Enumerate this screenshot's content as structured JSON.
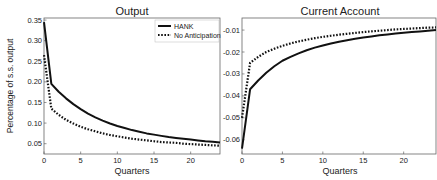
{
  "chart_data": [
    {
      "type": "line",
      "title": "Output",
      "xlabel": "Quarters",
      "ylabel": "Percentage of s.s. output",
      "xlim": [
        0,
        24
      ],
      "ylim": [
        0.025,
        0.355
      ],
      "xticks": [
        "0",
        "5",
        "10",
        "15",
        "20"
      ],
      "yticks": [
        "0.05",
        "0.10",
        "0.15",
        "0.20",
        "0.25",
        "0.30",
        "0.35"
      ],
      "grid": false,
      "legend": {
        "position": "upper right",
        "entries": [
          "HANK",
          "No Anticipation"
        ]
      },
      "x": [
        0,
        1,
        2,
        3,
        4,
        5,
        6,
        7,
        8,
        9,
        10,
        11,
        12,
        13,
        14,
        15,
        16,
        17,
        18,
        19,
        20,
        21,
        22,
        23,
        24
      ],
      "series": [
        {
          "name": "HANK",
          "style": "solid",
          "values": [
            0.345,
            0.195,
            0.176,
            0.16,
            0.146,
            0.134,
            0.123,
            0.114,
            0.106,
            0.099,
            0.093,
            0.088,
            0.083,
            0.079,
            0.075,
            0.072,
            0.069,
            0.066,
            0.064,
            0.062,
            0.06,
            0.058,
            0.056,
            0.055,
            0.053
          ]
        },
        {
          "name": "No Anticipation",
          "style": "dotted",
          "values": [
            0.265,
            0.135,
            0.12,
            0.108,
            0.099,
            0.091,
            0.085,
            0.08,
            0.075,
            0.071,
            0.068,
            0.065,
            0.062,
            0.06,
            0.058,
            0.056,
            0.054,
            0.053,
            0.052,
            0.05,
            0.049,
            0.048,
            0.047,
            0.046,
            0.045
          ]
        }
      ]
    },
    {
      "type": "line",
      "title": "Current Account",
      "xlabel": "Quarters",
      "ylabel": "",
      "xlim": [
        0,
        24
      ],
      "ylim": [
        -0.0665,
        -0.0045
      ],
      "xticks": [
        "0",
        "5",
        "10",
        "15",
        "20"
      ],
      "yticks": [
        "-0.06",
        "-0.05",
        "-0.04",
        "-0.03",
        "-0.02",
        "-0.01"
      ],
      "grid": false,
      "x": [
        0,
        1,
        2,
        3,
        4,
        5,
        6,
        7,
        8,
        9,
        10,
        11,
        12,
        13,
        14,
        15,
        16,
        17,
        18,
        19,
        20,
        21,
        22,
        23,
        24
      ],
      "series": [
        {
          "name": "HANK",
          "style": "solid",
          "values": [
            -0.064,
            -0.037,
            -0.033,
            -0.0295,
            -0.0265,
            -0.024,
            -0.0222,
            -0.0206,
            -0.0192,
            -0.018,
            -0.017,
            -0.0161,
            -0.0153,
            -0.0146,
            -0.014,
            -0.0134,
            -0.0129,
            -0.0124,
            -0.012,
            -0.0116,
            -0.0112,
            -0.0109,
            -0.0106,
            -0.0103,
            -0.01
          ]
        },
        {
          "name": "No Anticipation",
          "style": "dotted",
          "values": [
            -0.05,
            -0.025,
            -0.0222,
            -0.02,
            -0.0185,
            -0.0172,
            -0.0161,
            -0.0152,
            -0.0144,
            -0.0137,
            -0.0131,
            -0.0126,
            -0.0121,
            -0.0117,
            -0.0113,
            -0.0109,
            -0.0106,
            -0.0103,
            -0.01,
            -0.0097,
            -0.0095,
            -0.0093,
            -0.0091,
            -0.0089,
            -0.0088
          ]
        }
      ]
    }
  ],
  "colors": {
    "line": "#111111",
    "axis": "#555555",
    "text": "#222222",
    "background": "#ffffff"
  }
}
